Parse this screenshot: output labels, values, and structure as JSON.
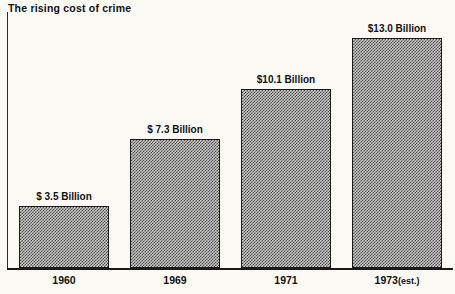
{
  "chart_data": {
    "type": "bar",
    "title": "The rising cost of crime",
    "xlabel": "",
    "ylabel": "",
    "categories": [
      "1960",
      "1969",
      "1971",
      "1973 (est.)"
    ],
    "values": [
      3.5,
      7.3,
      10.1,
      13.0
    ],
    "value_labels": [
      "$ 3.5 Billion",
      "$ 7.3 Billion",
      "$10.1 Billion",
      "$13.0 Billion"
    ],
    "units": "Billion US dollars",
    "ylim": [
      0,
      14.2
    ],
    "grid": false,
    "legend": "none",
    "bar_fill": "#c9c9c6",
    "bar_pattern": "halftone-dither-50",
    "bar_outline": "#1a1a1a",
    "background": "#fbfaf5",
    "text_color": "#111111",
    "axis": {
      "baseline": true,
      "left_rule": true,
      "ticks": false
    }
  },
  "bars": [
    {
      "year": "1960",
      "year_main": "1960",
      "year_suffix": "",
      "value": 3.5,
      "value_label": "$ 3.5 Billion"
    },
    {
      "year": "1969",
      "year_main": "1969",
      "year_suffix": "",
      "value": 7.3,
      "value_label": "$ 7.3 Billion"
    },
    {
      "year": "1971",
      "year_main": "1971",
      "year_suffix": "",
      "value": 10.1,
      "value_label": "$10.1 Billion"
    },
    {
      "year": "1973 (est.)",
      "year_main": "1973",
      "year_suffix": "(est.)",
      "value": 13.0,
      "value_label": "$13.0 Billion"
    }
  ]
}
